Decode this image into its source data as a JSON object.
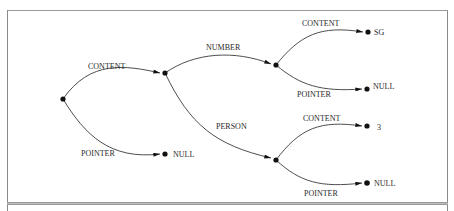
{
  "diagram": {
    "type": "tree",
    "colors": {
      "line": "#3a3a3a",
      "text": "#2a2a2a",
      "node": "#111111",
      "frame": "#8a8a8a"
    },
    "nodes": [
      {
        "id": "root",
        "label": "",
        "x": 63,
        "y": 99
      },
      {
        "id": "n_content",
        "label": "",
        "x": 165,
        "y": 73
      },
      {
        "id": "null_root",
        "label": "NULL",
        "x": 165,
        "y": 154
      },
      {
        "id": "n_number",
        "label": "",
        "x": 276,
        "y": 65
      },
      {
        "id": "n_person",
        "label": "",
        "x": 276,
        "y": 160
      },
      {
        "id": "sg",
        "label": "SG",
        "x": 368,
        "y": 32
      },
      {
        "id": "null_number",
        "label": "NULL",
        "x": 367,
        "y": 89
      },
      {
        "id": "three",
        "label": "3",
        "x": 367,
        "y": 126
      },
      {
        "id": "null_person",
        "label": "NULL",
        "x": 367,
        "y": 183
      }
    ],
    "edges": [
      {
        "from": "root",
        "to": "n_content",
        "label": "CONTENT"
      },
      {
        "from": "root",
        "to": "null_root",
        "label": "POINTER"
      },
      {
        "from": "n_content",
        "to": "n_number",
        "label": "NUMBER"
      },
      {
        "from": "n_content",
        "to": "n_person",
        "label": "PERSON"
      },
      {
        "from": "n_number",
        "to": "sg",
        "label": "CONTENT"
      },
      {
        "from": "n_number",
        "to": "null_number",
        "label": "POINTER"
      },
      {
        "from": "n_person",
        "to": "three",
        "label": "CONTENT"
      },
      {
        "from": "n_person",
        "to": "null_person",
        "label": "POINTER"
      }
    ]
  }
}
